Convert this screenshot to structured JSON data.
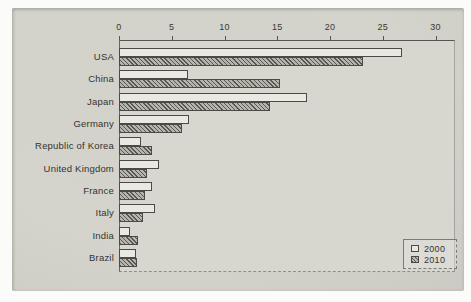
{
  "chart_data": {
    "type": "bar",
    "orientation": "horizontal",
    "title": "",
    "xlabel": "",
    "ylabel": "",
    "categories": [
      "USA",
      "China",
      "Japan",
      "Germany",
      "Republic of Korea",
      "United Kingdom",
      "France",
      "Italy",
      "India",
      "Brazil"
    ],
    "series": [
      {
        "name": "2000",
        "values": [
          26.8,
          6.5,
          17.8,
          6.6,
          2.1,
          3.8,
          3.1,
          3.4,
          1.0,
          1.6
        ]
      },
      {
        "name": "2010",
        "values": [
          23.1,
          15.3,
          14.3,
          6.0,
          3.1,
          2.7,
          2.5,
          2.3,
          1.8,
          1.7
        ]
      }
    ],
    "x_ticks": [
      0,
      5,
      10,
      15,
      20,
      25,
      30
    ],
    "x_tick_labels": [
      "0",
      "5",
      "10",
      "15",
      "20",
      "25",
      "30"
    ],
    "xlim": [
      0,
      31.4
    ],
    "axis_position": "top",
    "grid": false,
    "legend": {
      "position": "bottom-right",
      "entries": [
        "2000",
        "2010"
      ]
    },
    "colors": {
      "paper": "#d2d1ca",
      "plot_bg": "#d7d6cf",
      "bar_2000_fill": "#e9e8e1",
      "bar_2010_base": "#b5b4ad",
      "bar_2010_hatch": "#585752",
      "bar_border": "#4b4a46",
      "text": "#343330"
    }
  }
}
